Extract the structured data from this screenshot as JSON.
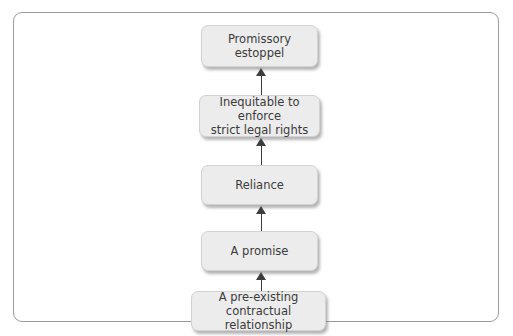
{
  "diagram": {
    "colors": {
      "frame_border": "#9a9a9a",
      "node_fill": "#ececec",
      "node_border": "#d2d2d2",
      "text": "#3b3b3b",
      "arrow": "#3d3d3d",
      "background": "#ffffff"
    },
    "direction": "bottom-to-top",
    "nodes": [
      {
        "id": "promissory-estoppel",
        "label": "Promissory\nestoppel"
      },
      {
        "id": "inequitable-to-enforce",
        "label": "Inequitable to enforce\nstrict legal rights"
      },
      {
        "id": "reliance",
        "label": "Reliance"
      },
      {
        "id": "a-promise",
        "label": "A promise"
      },
      {
        "id": "pre-existing-relationship",
        "label": "A pre-existing\ncontractual relationship"
      }
    ],
    "connectors": [
      {
        "id": "arrow-inequitable-to-estoppel",
        "from": "inequitable-to-enforce",
        "to": "promissory-estoppel",
        "glyph": "up-arrow"
      },
      {
        "id": "arrow-reliance-to-inequitable",
        "from": "reliance",
        "to": "inequitable-to-enforce",
        "glyph": "up-arrow"
      },
      {
        "id": "arrow-promise-to-reliance",
        "from": "a-promise",
        "to": "reliance",
        "glyph": "up-arrow"
      },
      {
        "id": "arrow-relationship-to-promise",
        "from": "pre-existing-relationship",
        "to": "a-promise",
        "glyph": "up-arrow"
      }
    ]
  }
}
